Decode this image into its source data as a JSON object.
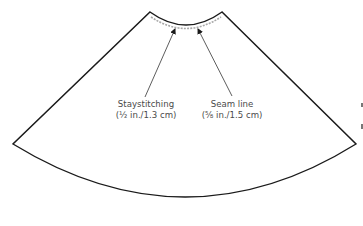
{
  "diagram": {
    "colors": {
      "outline": "#1a1a1a",
      "stitching": "#a8a8a8",
      "text": "#4a4a4a",
      "background": "#ffffff"
    },
    "labels": {
      "staystitching": {
        "title": "Staystitching",
        "measure": "(½ in./1.3 cm)"
      },
      "seam_line": {
        "title": "Seam line",
        "measure": "(⅝ in./1.5 cm)"
      }
    }
  }
}
